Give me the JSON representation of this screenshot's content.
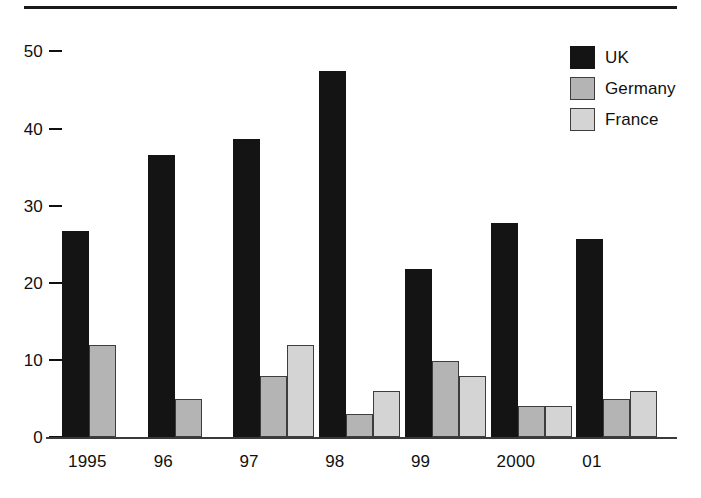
{
  "chart_data": {
    "type": "bar",
    "title": "",
    "subtitle": "",
    "xlabel": "",
    "ylabel": "",
    "categories": [
      "1995",
      "96",
      "97",
      "98",
      "99",
      "2000",
      "01"
    ],
    "series": [
      {
        "name": "UK",
        "color": "#141414",
        "values": [
          27,
          37,
          39,
          48,
          22,
          28,
          26
        ]
      },
      {
        "name": "Germany",
        "color": "#b4b4b4",
        "values": [
          12,
          5,
          8,
          3,
          10,
          4,
          5
        ]
      },
      {
        "name": "France",
        "color": "#d4d4d4",
        "values": [
          0,
          0,
          12,
          6,
          8,
          4,
          6
        ]
      }
    ],
    "ylim": [
      0,
      52
    ],
    "yticks": [
      0,
      10,
      20,
      30,
      40,
      50
    ],
    "ytick_labels": [
      "0",
      "10",
      "20",
      "30",
      "40",
      "50"
    ],
    "grid": false,
    "legend_position": "top-right"
  },
  "legend": {
    "entries": [
      {
        "label": "UK"
      },
      {
        "label": "Germany"
      },
      {
        "label": "France"
      }
    ]
  },
  "axes": {
    "y_ticks": [
      {
        "label": "50"
      },
      {
        "label": "40"
      },
      {
        "label": "30"
      },
      {
        "label": "20"
      },
      {
        "label": "10"
      },
      {
        "label": "0"
      }
    ],
    "x_labels": [
      {
        "label": "1995"
      },
      {
        "label": "96"
      },
      {
        "label": "97"
      },
      {
        "label": "98"
      },
      {
        "label": "99"
      },
      {
        "label": "2000"
      },
      {
        "label": "01"
      }
    ]
  }
}
